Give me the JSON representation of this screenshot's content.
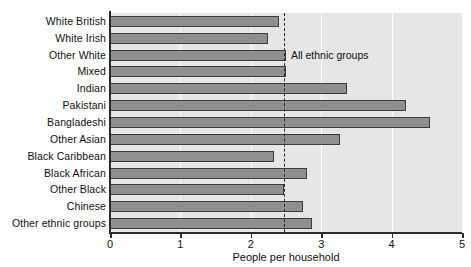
{
  "chart_data": {
    "type": "bar",
    "orientation": "horizontal",
    "title": "",
    "xlabel": "People per household",
    "ylabel": "",
    "xlim": [
      0,
      5
    ],
    "xticks": [
      "0",
      "1",
      "2",
      "3",
      "4",
      "5"
    ],
    "grid": "vertical white gridlines at each integer",
    "legend": "none",
    "categories": [
      "White British",
      "White Irish",
      "Other White",
      "Mixed",
      "Indian",
      "Pakistani",
      "Bangladeshi",
      "Other Asian",
      "Black Caribbean",
      "Black African",
      "Other Black",
      "Chinese",
      "Other ethnic groups"
    ],
    "values": [
      2.4,
      2.25,
      2.5,
      2.5,
      3.37,
      4.2,
      4.55,
      3.27,
      2.33,
      2.8,
      2.47,
      2.74,
      2.87
    ],
    "annotations": [
      {
        "label": "All ethnic groups",
        "type": "reference-line",
        "value": 2.47,
        "style": "dashed vertical"
      }
    ],
    "colors": {
      "bar_fill": "#8f8f8f",
      "bar_border": "#3d3d3d",
      "plot_background": "#e6e6e6",
      "gridline": "#fdfdfd",
      "axis": "#2b2b2b",
      "text": "#111111"
    }
  }
}
